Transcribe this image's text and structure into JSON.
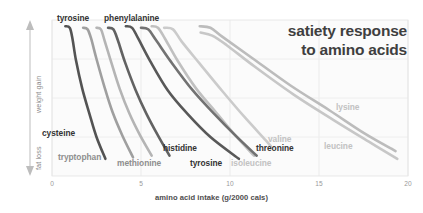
{
  "chart_data": {
    "type": "line",
    "title": [
      "satiety response",
      "to amino acids"
    ],
    "xlabel": "amino acid intake (g/2000 cals)",
    "ylabel_top": "weight gain",
    "ylabel_bottom": "fat loss",
    "xlim": [
      0,
      20
    ],
    "ylim": [
      0,
      100
    ],
    "xticks": [
      0,
      5,
      10,
      15,
      20
    ],
    "xtick_labels": [
      "0",
      "5",
      "10",
      "15",
      "20"
    ],
    "yticks": [],
    "grid": true,
    "legend": "inline-annotations",
    "series": [
      {
        "name": "cysteine",
        "color": "#4a4a4a",
        "weight": "dark",
        "x": [
          0.75,
          1.0,
          1.15,
          1.35,
          1.7,
          2.1,
          2.5,
          3.0
        ],
        "y": [
          96,
          95,
          88,
          74,
          56,
          40,
          25,
          11
        ]
      },
      {
        "name": "tryptophan",
        "color": "#9a9a9a",
        "weight": "mid",
        "x": [
          1.75,
          2.0,
          2.2,
          2.5,
          2.95,
          3.4,
          3.95,
          4.55
        ],
        "y": [
          95,
          94,
          88,
          75,
          57,
          41,
          26,
          12
        ]
      },
      {
        "name": "methionine",
        "color": "#b0b0b0",
        "weight": "mid",
        "x": [
          2.5,
          2.75,
          2.95,
          3.3,
          3.8,
          4.35,
          4.95,
          5.6
        ],
        "y": [
          95,
          94,
          87,
          74,
          56,
          40,
          26,
          13
        ]
      },
      {
        "name": "histidine",
        "color": "#5a5a5a",
        "weight": "dark",
        "x": [
          3.15,
          3.45,
          3.7,
          4.1,
          4.7,
          5.3,
          5.95,
          6.6
        ],
        "y": [
          95,
          94,
          87,
          73,
          55,
          40,
          26,
          13
        ]
      },
      {
        "name": "tyrosine",
        "color": "#4f4f4f",
        "weight": "dark",
        "x": [
          4.15,
          4.5,
          4.85,
          5.5,
          6.5,
          7.6,
          8.9,
          10.5
        ],
        "y": [
          96,
          95,
          88,
          74,
          55,
          40,
          25,
          11
        ]
      },
      {
        "name": "isoleucine",
        "color": "#bdbdbd",
        "weight": "light",
        "x": [
          5.6,
          5.95,
          6.35,
          7.05,
          8.1,
          9.2,
          10.3,
          11.35
        ],
        "y": [
          96,
          95,
          88,
          74,
          56,
          41,
          26,
          13
        ]
      },
      {
        "name": "threonine",
        "color": "#6a6a6a",
        "weight": "dark",
        "x": [
          5.0,
          5.4,
          5.85,
          6.7,
          7.9,
          9.1,
          10.3,
          11.5
        ],
        "y": [
          95,
          94,
          87,
          73,
          55,
          40,
          26,
          13
        ]
      },
      {
        "name": "valine",
        "color": "#c8c8c8",
        "weight": "light",
        "x": [
          6.3,
          6.8,
          7.3,
          8.3,
          9.6,
          10.8,
          12.0,
          12.3
        ],
        "y": [
          95,
          94,
          86,
          72,
          54,
          38,
          23,
          19
        ]
      },
      {
        "name": "lysine",
        "color": "#b8b8b8",
        "weight": "light",
        "x": [
          8.3,
          8.9,
          9.6,
          11.2,
          13.4,
          15.6,
          17.6,
          19.3
        ],
        "y": [
          96,
          95,
          89,
          76,
          58,
          42,
          27,
          16
        ]
      },
      {
        "name": "leucine",
        "color": "#c4c4c4",
        "weight": "light",
        "x": [
          8.35,
          9.0,
          9.8,
          11.4,
          13.6,
          15.8,
          17.8,
          19.4
        ],
        "y": [
          92,
          90,
          84,
          70,
          52,
          36,
          22,
          11
        ]
      }
    ],
    "annotations": [
      {
        "text": "tyrosine",
        "x_px": 57,
        "y_px": 13,
        "style": "dark"
      },
      {
        "text": "phenylalanine",
        "x_px": 104,
        "y_px": 13,
        "style": "dark"
      },
      {
        "text": "cysteine",
        "x_px": 42,
        "y_px": 128,
        "style": "dark"
      },
      {
        "text": "tryptophan",
        "x_px": 58,
        "y_px": 152,
        "style": "mid"
      },
      {
        "text": "methionine",
        "x_px": 117,
        "y_px": 158,
        "style": "mid"
      },
      {
        "text": "histidine",
        "x_px": 163,
        "y_px": 143,
        "style": "dark"
      },
      {
        "text": "tyrosine",
        "x_px": 190,
        "y_px": 158,
        "style": "dark"
      },
      {
        "text": "isoleucine",
        "x_px": 231,
        "y_px": 158,
        "style": "light"
      },
      {
        "text": "threonine",
        "x_px": 256,
        "y_px": 143,
        "style": "dark"
      },
      {
        "text": "valine",
        "x_px": 268,
        "y_px": 134,
        "style": "light"
      },
      {
        "text": "lysine",
        "x_px": 336,
        "y_px": 102,
        "style": "light"
      },
      {
        "text": "leucine",
        "x_px": 324,
        "y_px": 141,
        "style": "light"
      }
    ]
  },
  "axes_geometry": {
    "plot_left_px": 52,
    "plot_right_px": 408,
    "plot_top_px": 20,
    "plot_bottom_px": 176
  }
}
